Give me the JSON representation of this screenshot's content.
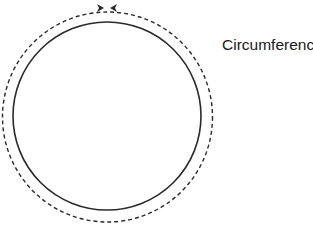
{
  "diagram": {
    "label": "Circumference",
    "colors": {
      "stroke": "#2a2a2a",
      "background": "#ffffff"
    },
    "shapes": {
      "solid_circle": {
        "cx": 107,
        "cy": 116,
        "r": 94
      },
      "dashed_circle": {
        "cx": 107.5,
        "cy": 117,
        "r": 105
      },
      "arrows": "two arrowheads meeting at top of dashed circle"
    }
  }
}
